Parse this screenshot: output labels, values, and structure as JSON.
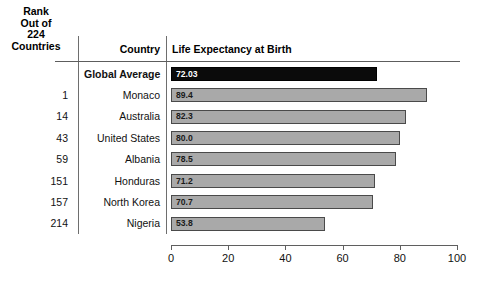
{
  "headers": {
    "rank": "Rank\nOut of\n224\nCountries",
    "rank_line1": "Rank",
    "rank_line2": "Out of",
    "rank_line3": "224",
    "rank_line4": "Countries",
    "country": "Country",
    "metric": "Life Expectancy at Birth"
  },
  "axis": {
    "ticks": [
      "0",
      "20",
      "40",
      "60",
      "80",
      "100"
    ]
  },
  "rows": [
    {
      "rank": "",
      "country": "Global Average",
      "value": "72.03",
      "num": 72.03
    },
    {
      "rank": "1",
      "country": "Monaco",
      "value": "89.4",
      "num": 89.4
    },
    {
      "rank": "14",
      "country": "Australia",
      "value": "82.3",
      "num": 82.3
    },
    {
      "rank": "43",
      "country": "United States",
      "value": "80.0",
      "num": 80.0
    },
    {
      "rank": "59",
      "country": "Albania",
      "value": "78.5",
      "num": 78.5
    },
    {
      "rank": "151",
      "country": "Honduras",
      "value": "71.2",
      "num": 71.2
    },
    {
      "rank": "157",
      "country": "North Korea",
      "value": "70.7",
      "num": 70.7
    },
    {
      "rank": "214",
      "country": "Nigeria",
      "value": "53.8",
      "num": 53.8
    }
  ],
  "chart_data": {
    "type": "bar",
    "orientation": "horizontal",
    "title": "Life Expectancy at Birth",
    "xlabel": "",
    "ylabel": "",
    "xlim": [
      0,
      100
    ],
    "xticks": [
      0,
      20,
      40,
      60,
      80,
      100
    ],
    "grid": false,
    "legend": null,
    "categories": [
      "Global Average",
      "Monaco",
      "Australia",
      "United States",
      "Albania",
      "Honduras",
      "North Korea",
      "Nigeria"
    ],
    "values": [
      72.03,
      89.4,
      82.3,
      80.0,
      78.5,
      71.2,
      70.7,
      53.8
    ],
    "data_labels": [
      "72.03",
      "89.4",
      "82.3",
      "80.0",
      "78.5",
      "71.2",
      "70.7",
      "53.8"
    ],
    "ranks": [
      "",
      "1",
      "14",
      "43",
      "59",
      "151",
      "157",
      "214"
    ],
    "rank_header": "Rank Out of 224 Countries",
    "highlight_category": "Global Average",
    "highlight_color": "#0b0b0b",
    "bar_color": "#a9a9a9",
    "bar_border_color": "#4a4a4a"
  }
}
